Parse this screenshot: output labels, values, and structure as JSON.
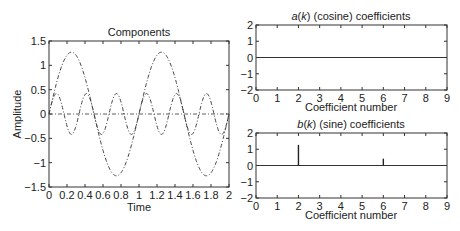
{
  "chart_data": [
    {
      "id": "components",
      "type": "line",
      "title": "Components",
      "xlabel": "Time",
      "ylabel": "Amplitude",
      "xlim": [
        0,
        2
      ],
      "ylim": [
        -1.5,
        1.5
      ],
      "xticks": [
        0,
        0.2,
        0.4,
        0.6,
        0.8,
        1,
        1.2,
        1.4,
        1.6,
        1.8,
        2
      ],
      "xtick_labels": [
        "0",
        "0.2",
        "0.4",
        "0.6",
        "0.8",
        "1",
        "1.2",
        "1.4",
        "1.6",
        "1.8",
        "2"
      ],
      "yticks": [
        1.5,
        1,
        0.5,
        0,
        -0.5,
        -1,
        -1.5
      ],
      "ytick_labels": [
        "1.5",
        "1",
        "0.5",
        "0",
        "−0.5",
        "−1",
        "−1.5"
      ],
      "grid": false,
      "series": [
        {
          "name": "sine component k=2",
          "function": "sine",
          "amplitude": 1.27,
          "frequency_hz": 1,
          "style": "dash-dot"
        },
        {
          "name": "sine component k=6",
          "function": "sine",
          "amplitude": 0.42,
          "frequency_hz": 3,
          "style": "dash-dot"
        },
        {
          "name": "cosine components",
          "function": "constant",
          "amplitude": 0,
          "frequency_hz": 0,
          "style": "dash-dot"
        }
      ]
    },
    {
      "id": "cosine",
      "type": "bar",
      "title_parts": [
        "a",
        "(",
        "k",
        ") (cosine) coefficients"
      ],
      "title": "a(k) (cosine) coefficients",
      "xlabel": "Coefficient number",
      "ylabel": "",
      "xlim": [
        0,
        9
      ],
      "ylim": [
        -2,
        2
      ],
      "xticks": [
        0,
        1,
        2,
        3,
        4,
        5,
        6,
        7,
        8,
        9
      ],
      "xtick_labels": [
        "0",
        "1",
        "2",
        "3",
        "4",
        "5",
        "6",
        "7",
        "8",
        "9"
      ],
      "yticks": [
        2,
        1,
        0,
        -1,
        -2
      ],
      "ytick_labels": [
        "2",
        "1",
        "0",
        "−1",
        "−2"
      ],
      "categories": [
        0,
        1,
        2,
        3,
        4,
        5,
        6,
        7,
        8,
        9
      ],
      "values": [
        0,
        0,
        0,
        0,
        0,
        0,
        0,
        0,
        0,
        0
      ]
    },
    {
      "id": "sine",
      "type": "bar",
      "title_parts": [
        "b",
        "(",
        "k",
        ") (sine) coefficients"
      ],
      "title": "b(k) (sine) coefficients",
      "xlabel": "Coefficient number",
      "ylabel": "",
      "xlim": [
        0,
        9
      ],
      "ylim": [
        -2,
        2
      ],
      "xticks": [
        0,
        1,
        2,
        3,
        4,
        5,
        6,
        7,
        8,
        9
      ],
      "xtick_labels": [
        "0",
        "1",
        "2",
        "3",
        "4",
        "5",
        "6",
        "7",
        "8",
        "9"
      ],
      "yticks": [
        2,
        1,
        0,
        -1,
        -2
      ],
      "ytick_labels": [
        "2",
        "1",
        "0",
        "−1",
        "−2"
      ],
      "categories": [
        0,
        1,
        2,
        3,
        4,
        5,
        6,
        7,
        8,
        9
      ],
      "values": [
        0,
        0,
        1.27,
        0,
        0,
        0,
        0.42,
        0,
        0,
        0
      ]
    }
  ]
}
